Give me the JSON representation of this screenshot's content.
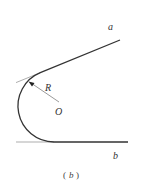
{
  "figure": {
    "labels": {
      "line_a": "a",
      "line_b": "b",
      "radius": "R",
      "center": "O"
    },
    "caption": {
      "open": "(",
      "letter": "b",
      "close": ")"
    },
    "colors": {
      "stroke": "#333333",
      "thin_stroke": "#666666"
    }
  }
}
